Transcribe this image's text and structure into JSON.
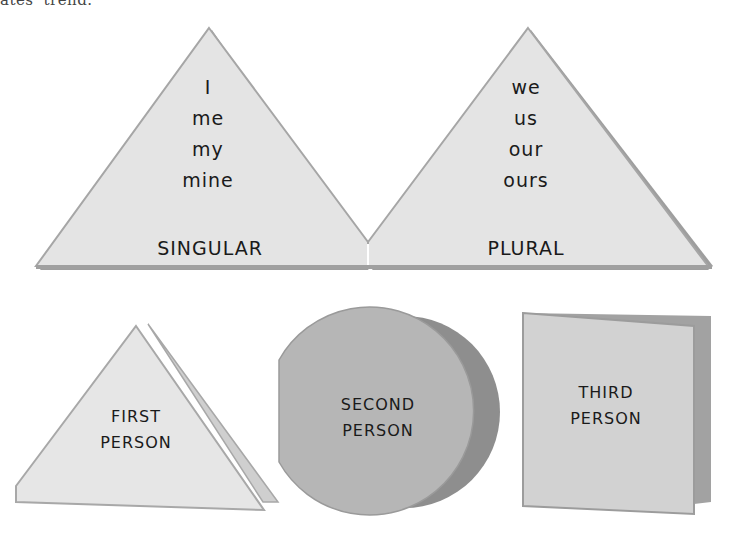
{
  "caption_fragment": "ates' trend.",
  "top_shapes": {
    "singular": {
      "words": [
        "I",
        "me",
        "my",
        "mine"
      ],
      "label": "SINGULAR"
    },
    "plural": {
      "words": [
        "we",
        "us",
        "our",
        "ours"
      ],
      "label": "PLURAL"
    }
  },
  "bottom_shapes": {
    "first": {
      "shape": "triangle",
      "line1": "FIRST",
      "line2": "PERSON"
    },
    "second": {
      "shape": "circle",
      "line1": "SECOND",
      "line2": "PERSON"
    },
    "third": {
      "shape": "square-card",
      "line1": "THIRD",
      "line2": "PERSON"
    }
  },
  "colors": {
    "light_fill": "#e4e4e4",
    "edge": "#a8a8a8",
    "circle_fill": "#b4b4b4",
    "circle_back": "#8e8e8e",
    "square_fill": "#d0d0d0",
    "square_back": "#a2a2a2"
  }
}
